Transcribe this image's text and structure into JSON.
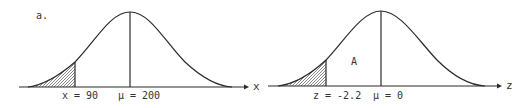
{
  "figure": {
    "panel_label": "a.",
    "colors": {
      "ink": "#2a2a2a",
      "background": "#ffffff"
    },
    "left_curve": {
      "axis_label": "x",
      "cutoff_label": "x = 90",
      "mean_label": "μ = 200",
      "shaded_region": "left tail below x = 90"
    },
    "right_curve": {
      "axis_label": "z",
      "cutoff_label": "z = -2.2",
      "mean_label": "μ = 0",
      "area_label": "A",
      "shaded_region": "left tail below z = -2.2"
    }
  }
}
